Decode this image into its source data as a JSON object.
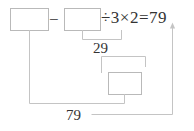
{
  "diagram": {
    "type": "work-backwards-flow",
    "equation": {
      "left_operand_box": "",
      "operator_subtract": "−",
      "right_operand_box": "",
      "tail_expression": "÷3×2=79",
      "divide_symbol": "÷",
      "divisor": "3",
      "multiply_symbol": "×",
      "multiplier": "2",
      "equals_symbol": "=",
      "result": "79"
    },
    "boxes": [
      {
        "name": "box-1",
        "value": ""
      },
      {
        "name": "box-2",
        "value": ""
      },
      {
        "name": "box-3",
        "value": ""
      }
    ],
    "annotations": [
      {
        "name": "intermediate-29",
        "value": "29"
      },
      {
        "name": "total-79",
        "value": "79"
      }
    ],
    "colors": {
      "box_border": "#b9b9b9",
      "connector": "#c4c4c4",
      "text": "#333333",
      "background": "#ffffff"
    }
  }
}
